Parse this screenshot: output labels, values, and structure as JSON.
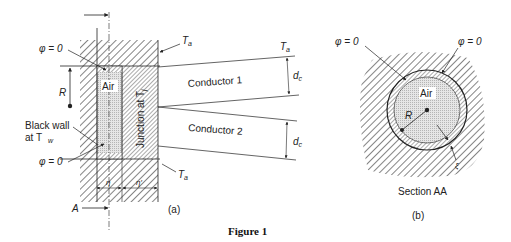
{
  "figure": {
    "caption": "Figure 1",
    "panel_a": {
      "label": "(a)",
      "phi_top": "φ = 0",
      "phi_bottom": "φ = 0",
      "radius_label": "R",
      "air_label": "Air",
      "junction_label": "Junction at T",
      "junction_sub": "j",
      "black_wall_line1": "Black wall",
      "black_wall_line2": "at T",
      "black_wall_sub": "w",
      "ta_top": "T",
      "ta_top_sub": "a",
      "ta_bottom": "T",
      "ta_bottom_sub": "a",
      "ta_conductor": "T",
      "ta_conductor_sub": "a",
      "conductor1": "Conductor 1",
      "conductor2": "Conductor 2",
      "dc1": "d",
      "dc1_sub": "c",
      "dc2": "d",
      "dc2_sub": "c",
      "eta": "η",
      "eta_prime": "η′",
      "section_marker": "A"
    },
    "panel_b": {
      "label": "(b)",
      "title": "Section AA",
      "phi_left": "φ = 0",
      "phi_right": "φ = 0",
      "air_label": "Air",
      "radius_label": "R",
      "xi_label": "ξ"
    }
  }
}
